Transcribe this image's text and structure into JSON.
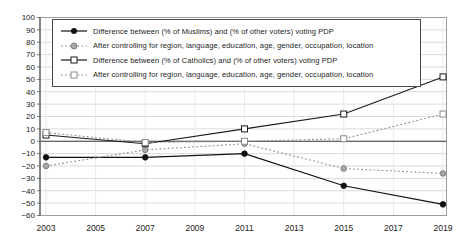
{
  "chart_data": {
    "type": "line",
    "title": "",
    "xlabel": "",
    "ylabel": "",
    "x": [
      2003,
      2007,
      2011,
      2015,
      2019
    ],
    "x_ticks": [
      2003,
      2005,
      2007,
      2009,
      2011,
      2013,
      2015,
      2017,
      2019
    ],
    "y_ticks": [
      100,
      90,
      80,
      70,
      60,
      50,
      40,
      30,
      20,
      10,
      0,
      -10,
      -20,
      -30,
      -40,
      -50,
      -60
    ],
    "ylim": [
      -60,
      100
    ],
    "grid": true,
    "legend_position": "top-left-inside",
    "series": [
      {
        "name": "muslims-difference",
        "label": "Difference between (% of Muslims) and (% of other voters) voting PDP",
        "values": [
          -13,
          -13,
          -10,
          -36,
          -51
        ],
        "color": "#111111",
        "line_style": "solid",
        "marker": "filled-circle",
        "marker_fill": "#111111",
        "marker_stroke": "#111111"
      },
      {
        "name": "muslims-after-controls",
        "label": "After controlling for region, language, education, age, gender, occupation, location",
        "values": [
          -20,
          -7,
          -2,
          -22,
          -26
        ],
        "color": "#8e8e8e",
        "line_style": "dotted",
        "marker": "filled-circle",
        "marker_fill": "#a8a8a8",
        "marker_stroke": "#6e6e6e"
      },
      {
        "name": "catholics-difference",
        "label": "Difference between (% of Catholics) and (% of other voters) voting PDP",
        "values": [
          5,
          -2,
          10,
          22,
          52
        ],
        "color": "#1a1a1a",
        "line_style": "solid",
        "marker": "open-square",
        "marker_fill": "#ffffff",
        "marker_stroke": "#1a1a1a"
      },
      {
        "name": "catholics-after-controls",
        "label": "After controlling for region, language, education, age, gender, occupation, location",
        "values": [
          7,
          -1,
          0,
          2,
          22
        ],
        "color": "#8e8e8e",
        "line_style": "dotted",
        "marker": "open-square",
        "marker_fill": "#ffffff",
        "marker_stroke": "#8a8a8a"
      }
    ]
  }
}
